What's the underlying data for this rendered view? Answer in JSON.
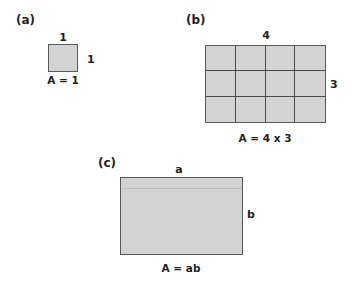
{
  "panels": {
    "a": {
      "label": "(a)",
      "top_dimension": "1",
      "side_dimension": "1",
      "formula": "A = 1"
    },
    "b": {
      "label": "(b)",
      "top_dimension": "4",
      "side_dimension": "3",
      "formula": "A = 4 x 3",
      "columns": 4,
      "rows": 3
    },
    "c": {
      "label": "(c)",
      "top_dimension": "a",
      "side_dimension": "b",
      "formula": "A = ab"
    }
  },
  "colors": {
    "fill": "#d3d3d3",
    "border": "#4a4a4a",
    "text": "#1f1f1f"
  }
}
